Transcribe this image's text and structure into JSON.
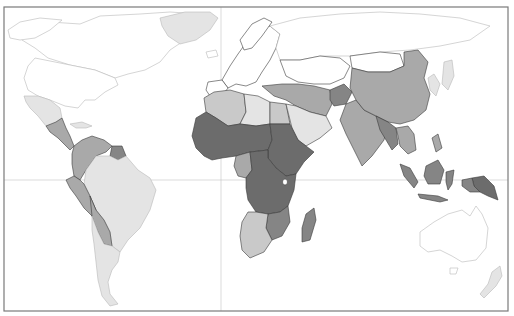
{
  "map": {
    "type": "choropleth world map (grayscale)",
    "title": "",
    "legend": [],
    "shades": {
      "none": "#ffffff",
      "very_low": "#e4e4e4",
      "low": "#c9c9c9",
      "medium": "#a9a9a9",
      "high": "#858585",
      "very_high": "#6c6c6c"
    },
    "gridlines": {
      "equator_y": 180,
      "prime_meridian_x": 221
    },
    "frame": {
      "x": 4,
      "y": 7,
      "width": 504,
      "height": 304
    },
    "regions": [
      {
        "name": "North America (Canada/USA)",
        "shade": "none"
      },
      {
        "name": "Greenland",
        "shade": "very_low"
      },
      {
        "name": "Mexico",
        "shade": "very_low"
      },
      {
        "name": "Central America",
        "shade": "medium"
      },
      {
        "name": "Caribbean",
        "shade": "very_low"
      },
      {
        "name": "Colombia/Venezuela",
        "shade": "medium"
      },
      {
        "name": "Guyana/Suriname",
        "shade": "high"
      },
      {
        "name": "Brazil",
        "shade": "very_low"
      },
      {
        "name": "Peru/Ecuador",
        "shade": "medium"
      },
      {
        "name": "Bolivia/Paraguay",
        "shade": "medium"
      },
      {
        "name": "Chile/Argentina",
        "shade": "very_low"
      },
      {
        "name": "Europe",
        "shade": "none"
      },
      {
        "name": "Russia/Central Asia",
        "shade": "none"
      },
      {
        "name": "North Africa (Morocco/Algeria/Libya)",
        "shade": "low"
      },
      {
        "name": "Egypt",
        "shade": "low"
      },
      {
        "name": "Sahel/West Africa",
        "shade": "very_high"
      },
      {
        "name": "Central/East Africa",
        "shade": "very_high"
      },
      {
        "name": "Gabon/Congo",
        "shade": "medium"
      },
      {
        "name": "Southern Africa",
        "shade": "low"
      },
      {
        "name": "Mozambique/Zimbabwe",
        "shade": "high"
      },
      {
        "name": "Madagascar",
        "shade": "high"
      },
      {
        "name": "Middle East (Arabia)",
        "shade": "very_low"
      },
      {
        "name": "Iran/Iraq/Turkey",
        "shade": "medium"
      },
      {
        "name": "Afghanistan",
        "shade": "high"
      },
      {
        "name": "Pakistan/India",
        "shade": "medium"
      },
      {
        "name": "China",
        "shade": "medium"
      },
      {
        "name": "Mongolia",
        "shade": "none"
      },
      {
        "name": "Nepal/Bangladesh/Myanmar",
        "shade": "high"
      },
      {
        "name": "Southeast Asia mainland",
        "shade": "medium"
      },
      {
        "name": "Indonesia",
        "shade": "high"
      },
      {
        "name": "Papua New Guinea",
        "shade": "very_high"
      },
      {
        "name": "Japan/Korea",
        "shade": "very_low"
      },
      {
        "name": "Australia",
        "shade": "none"
      },
      {
        "name": "New Zealand",
        "shade": "very_low"
      }
    ]
  }
}
